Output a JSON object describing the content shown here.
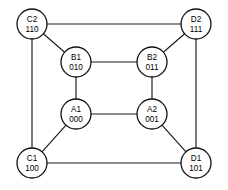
{
  "diagram": {
    "type": "cube-graph",
    "width": 228,
    "height": 190,
    "stroke_color": "#1a1a1a",
    "node_fill": "#ffffff",
    "node_stroke": "#111111",
    "background": "#ffffff",
    "node_radius": 15,
    "nodes": [
      {
        "id": "C2",
        "name": "C2",
        "code": "110",
        "x": 32,
        "y": 24,
        "position": "outer-top-left"
      },
      {
        "id": "D2",
        "name": "D2",
        "code": "111",
        "x": 196,
        "y": 24,
        "position": "outer-top-right"
      },
      {
        "id": "B1",
        "name": "B1",
        "code": "010",
        "x": 76,
        "y": 62,
        "position": "inner-top-left"
      },
      {
        "id": "B2",
        "name": "B2",
        "code": "011",
        "x": 152,
        "y": 62,
        "position": "inner-top-right"
      },
      {
        "id": "A1",
        "name": "A1",
        "code": "000",
        "x": 76,
        "y": 114,
        "position": "inner-bottom-left"
      },
      {
        "id": "A2",
        "name": "A2",
        "code": "001",
        "x": 152,
        "y": 114,
        "position": "inner-bottom-right"
      },
      {
        "id": "C1",
        "name": "C1",
        "code": "100",
        "x": 32,
        "y": 163,
        "position": "outer-bottom-left"
      },
      {
        "id": "D1",
        "name": "D1",
        "code": "101",
        "x": 196,
        "y": 163,
        "position": "outer-bottom-right"
      }
    ],
    "edges": [
      {
        "from": "C2",
        "to": "D2",
        "kind": "outer-top"
      },
      {
        "from": "C1",
        "to": "D1",
        "kind": "outer-bottom"
      },
      {
        "from": "C2",
        "to": "C1",
        "kind": "outer-left"
      },
      {
        "from": "D2",
        "to": "D1",
        "kind": "outer-right"
      },
      {
        "from": "B1",
        "to": "B2",
        "kind": "inner-top"
      },
      {
        "from": "A1",
        "to": "A2",
        "kind": "inner-bottom"
      },
      {
        "from": "B1",
        "to": "A1",
        "kind": "inner-left"
      },
      {
        "from": "B2",
        "to": "A2",
        "kind": "inner-right"
      },
      {
        "from": "C2",
        "to": "B1",
        "kind": "diagonal-top-left"
      },
      {
        "from": "D2",
        "to": "B2",
        "kind": "diagonal-top-right"
      },
      {
        "from": "C1",
        "to": "A1",
        "kind": "diagonal-bottom-left"
      },
      {
        "from": "D1",
        "to": "A2",
        "kind": "diagonal-bottom-right"
      }
    ]
  }
}
